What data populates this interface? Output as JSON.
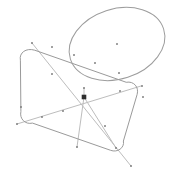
{
  "canvas": {
    "width": 175,
    "height": 173,
    "background": "#ffffff",
    "title": "Geometry Sketch"
  },
  "style": {
    "outline_color": "#9a9a9a",
    "ellipse_color": "#9d9d9d",
    "diagonal_color": "#bdbdbd",
    "marker_color": "#7a7a7a",
    "center_marker_color": "#2e2e2e",
    "outline_width": 1,
    "ellipse_width": 1,
    "diagonal_width": 1
  },
  "chart_data": {
    "type": "scatter",
    "xlabel": "",
    "ylabel": "",
    "xlim": [
      0,
      175
    ],
    "ylim": [
      0,
      173
    ],
    "grid": false,
    "legend": "none",
    "shapes": [
      {
        "name": "rounded-rectangle",
        "kind": "rounded-rect",
        "rotation_deg": -17,
        "corner_radius": 14,
        "corners": [
          {
            "label": "top-left",
            "x": 31,
            "y": 49
          },
          {
            "label": "top-right",
            "x": 137,
            "y": 82
          },
          {
            "label": "bottom-right",
            "x": 118,
            "y": 151
          },
          {
            "label": "bottom-left",
            "x": 21,
            "y": 118
          }
        ],
        "path": "M 34.4 50.1 C 26.1 47.6 18.9 52.7 20.4 60.2 L 20.9 111.5 C 19.3 118.7 25.1 124.8 32.5 123.1 L 110.6 150.3 C 117.2 152.9 124.8 148.0 123.4 141.0 L 137.1 94.5 C 139.2 87.2 133.9 80.9 126.6 82.2 Z"
      },
      {
        "name": "ellipse",
        "kind": "ellipse",
        "center": {
          "x": 117,
          "y": 44
        },
        "rx": 49,
        "ry": 35,
        "rotation_deg": -18
      }
    ],
    "lines": [
      {
        "name": "diagonal-main",
        "x1": 32,
        "y1": 43,
        "x2": 131,
        "y2": 166
      },
      {
        "name": "diagonal-cross",
        "x1": 17,
        "y1": 124,
        "x2": 141,
        "y2": 86
      },
      {
        "name": "center-to-bottom",
        "x1": 84,
        "y1": 97,
        "x2": 77,
        "y2": 147
      },
      {
        "name": "center-to-bottom-right",
        "x1": 84,
        "y1": 97,
        "x2": 116,
        "y2": 148
      },
      {
        "name": "center-to-top",
        "x1": 84,
        "y1": 97,
        "x2": 84,
        "y2": 88
      }
    ],
    "points": [
      {
        "label": "p1",
        "x": 32,
        "y": 43
      },
      {
        "label": "p2",
        "x": 52,
        "y": 47
      },
      {
        "label": "p3",
        "x": 74,
        "y": 55
      },
      {
        "label": "p4",
        "x": 95,
        "y": 63
      },
      {
        "label": "p5",
        "x": 119,
        "y": 73
      },
      {
        "label": "p6",
        "x": 142,
        "y": 86
      },
      {
        "label": "p7",
        "x": 17,
        "y": 124
      },
      {
        "label": "p8",
        "x": 42,
        "y": 117
      },
      {
        "label": "p9",
        "x": 63,
        "y": 111
      },
      {
        "label": "p10",
        "x": 120,
        "y": 91
      },
      {
        "label": "p11",
        "x": 143,
        "y": 97
      },
      {
        "label": "p12",
        "x": 52,
        "y": 74
      },
      {
        "label": "p13",
        "x": 77,
        "y": 147
      },
      {
        "label": "p14",
        "x": 116,
        "y": 148
      },
      {
        "label": "p15",
        "x": 131,
        "y": 166
      },
      {
        "label": "p16",
        "x": 105,
        "y": 126
      },
      {
        "label": "p17",
        "x": 21,
        "y": 107
      },
      {
        "label": "p18",
        "x": 84,
        "y": 88
      },
      {
        "label": "p19",
        "x": 117,
        "y": 44
      }
    ],
    "center_point": {
      "label": "origin",
      "x": 84,
      "y": 97
    }
  }
}
